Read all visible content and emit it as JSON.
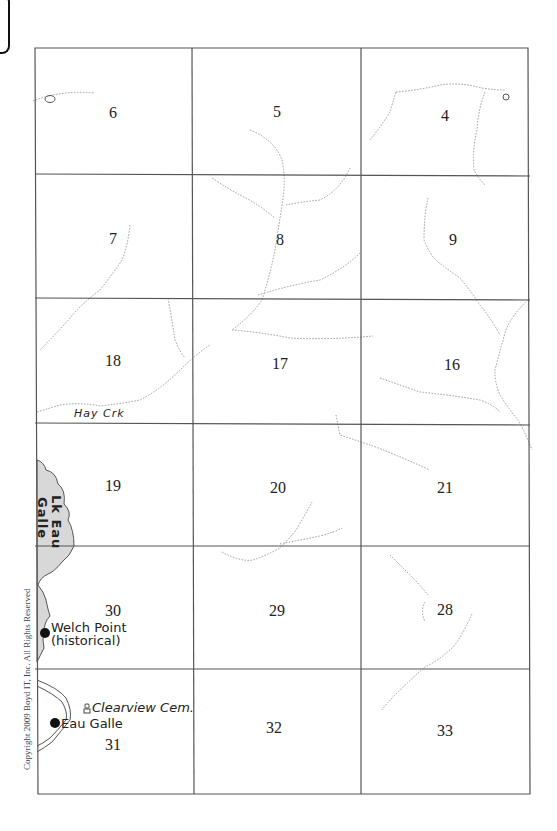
{
  "map": {
    "type": "township section plat map",
    "sections": [
      {
        "row": 0,
        "col": 0,
        "number": "6"
      },
      {
        "row": 0,
        "col": 1,
        "number": "5"
      },
      {
        "row": 0,
        "col": 2,
        "number": "4"
      },
      {
        "row": 1,
        "col": 0,
        "number": "7"
      },
      {
        "row": 1,
        "col": 1,
        "number": "8"
      },
      {
        "row": 1,
        "col": 2,
        "number": "9"
      },
      {
        "row": 2,
        "col": 0,
        "number": "18"
      },
      {
        "row": 2,
        "col": 1,
        "number": "17"
      },
      {
        "row": 2,
        "col": 2,
        "number": "16"
      },
      {
        "row": 3,
        "col": 0,
        "number": "19"
      },
      {
        "row": 3,
        "col": 1,
        "number": "20"
      },
      {
        "row": 3,
        "col": 2,
        "number": "21"
      },
      {
        "row": 4,
        "col": 0,
        "number": "30"
      },
      {
        "row": 4,
        "col": 1,
        "number": "29"
      },
      {
        "row": 4,
        "col": 2,
        "number": "28"
      },
      {
        "row": 5,
        "col": 0,
        "number": "31"
      },
      {
        "row": 5,
        "col": 1,
        "number": "32"
      },
      {
        "row": 5,
        "col": 2,
        "number": "33"
      }
    ],
    "labels": {
      "creek": "Hay Crk",
      "lake_line1": "Lk Eau",
      "lake_line2": "Galle",
      "welch_point_line1": "Welch Point",
      "welch_point_line2": "(historical)",
      "eau_galle": "Eau Galle",
      "cemetery": "Clearview Cem.",
      "copyright": "Copyright 2009 Boyd IT, Inc. All Rights Reserved"
    },
    "icons": {
      "town_marker": "filled-circle",
      "cemetery_marker": "cemetery-icon"
    },
    "colors": {
      "grid": "#555555",
      "stream": "#9a9a9a",
      "lake_fill": "#d8d8d8",
      "text": "#222222"
    }
  }
}
